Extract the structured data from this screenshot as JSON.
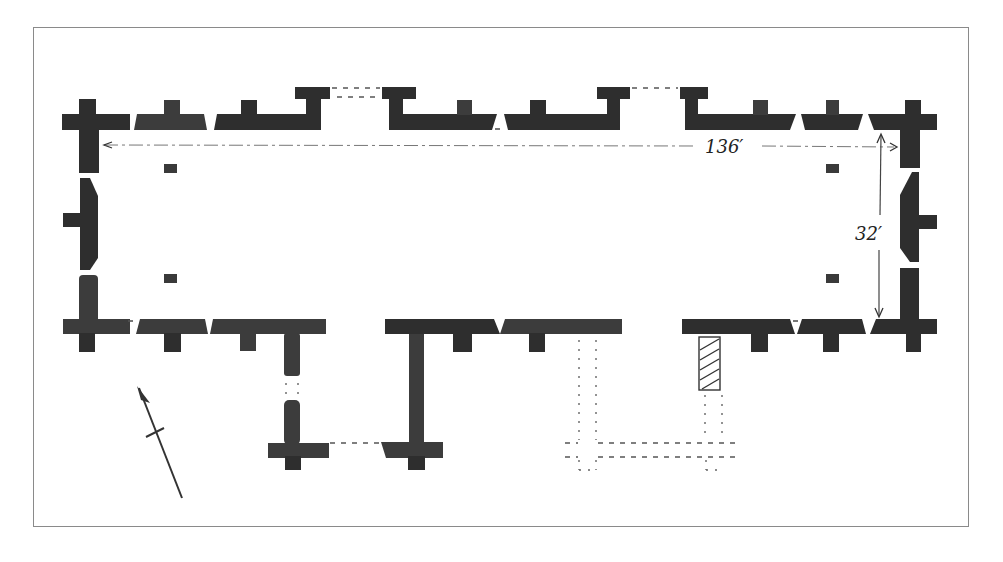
{
  "figure": {
    "type": "architectural floor plan",
    "dimensions": {
      "length_label": "136′",
      "width_label": "32′"
    },
    "north_arrow": "north-arrow",
    "legend": {
      "solid_walls": "existing walls",
      "dashed_lines": "missing / conjectural walls",
      "hatched_wall": "later wall"
    },
    "colors": {
      "wall": "#2e2e2e",
      "frame": "#8a8a8a",
      "background": "#ffffff"
    }
  }
}
